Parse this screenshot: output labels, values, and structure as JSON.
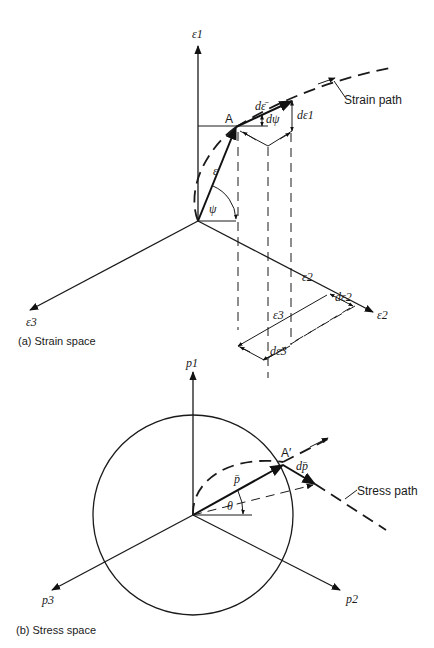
{
  "strain_space": {
    "caption": "(a)  Strain space",
    "axes": {
      "e1": "ε1",
      "e2": "ε2",
      "e3": "ε3"
    },
    "point_label": "A",
    "labels": {
      "d_eps_bar": "dε̄",
      "d_psi": "dψ",
      "d_eps1": "dε1",
      "eps_vec": "ε",
      "psi": "ψ",
      "eps2_proj": "ε2",
      "d_eps2": "dε2",
      "eps3_proj": "ε3",
      "d_eps3": "dε3"
    },
    "path_label": "Strain path"
  },
  "stress_space": {
    "caption": "(b)  Stress space",
    "axes": {
      "p1": "p1",
      "p2": "p2",
      "p3": "p3"
    },
    "point_label": "A′",
    "labels": {
      "p_bar": "p̄",
      "d_p_bar": "dp̄",
      "theta": "θ"
    },
    "path_label": "Stress path"
  }
}
